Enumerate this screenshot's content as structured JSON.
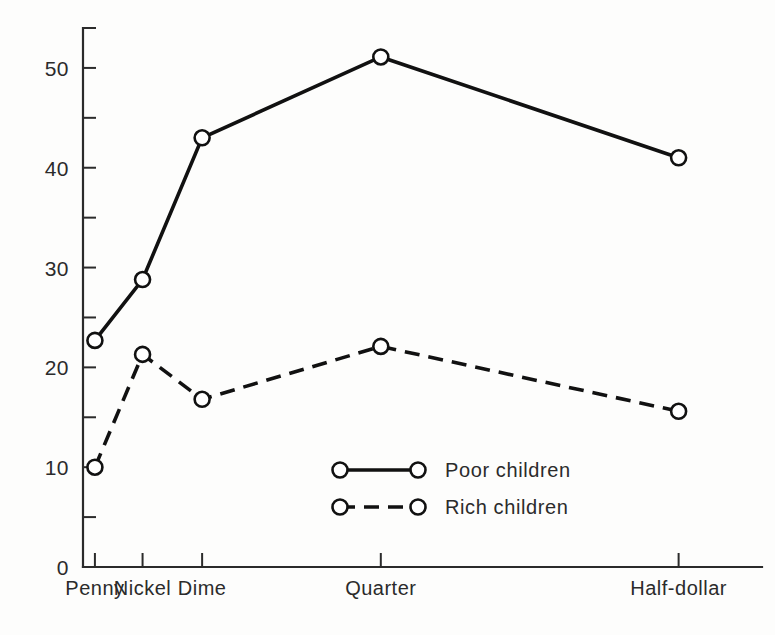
{
  "chart_data": {
    "type": "line",
    "title": "",
    "subtitle": "",
    "xlabel": "",
    "ylabel": "",
    "categories": [
      "Penny",
      "Nickel",
      "Dime",
      "Quarter",
      "Half-dollar"
    ],
    "x": [
      1,
      5,
      10,
      25,
      50
    ],
    "xlim": [
      0,
      57
    ],
    "ylim": [
      0,
      54
    ],
    "yticks_major": [
      0,
      10,
      20,
      30,
      40,
      50
    ],
    "yticks_minor": [
      5,
      15,
      25,
      35,
      45
    ],
    "ytick_labels": [
      "0",
      "10",
      "20",
      "30",
      "40",
      "50"
    ],
    "grid": false,
    "legend_position": "center",
    "series": [
      {
        "name": "Poor children",
        "style": "solid",
        "marker": "open-circle",
        "color": "#111111",
        "values": [
          22.7,
          28.8,
          43.0,
          51.1,
          41.0
        ]
      },
      {
        "name": "Rich children",
        "style": "dashed",
        "marker": "open-circle",
        "color": "#111111",
        "values": [
          10.0,
          21.3,
          16.8,
          22.1,
          15.6
        ]
      }
    ]
  },
  "legend": {
    "entries": [
      {
        "label": "Poor children",
        "style": "solid"
      },
      {
        "label": "Rich children",
        "style": "dashed"
      }
    ]
  },
  "colors": {
    "ink": "#111111",
    "axis": "#2b2b2b",
    "background": "#fdfdfc",
    "marker_fill": "#ffffff"
  }
}
